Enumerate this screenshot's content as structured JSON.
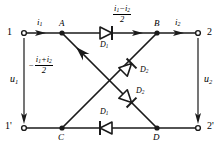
{
  "figure": {
    "type": "circuit-diagram",
    "stroke_color": "#1a1a1a",
    "background_color": "#ffffff"
  },
  "terminals": [
    {
      "name": "terminal-1",
      "label": "1",
      "x": 18,
      "y": 33
    },
    {
      "name": "terminal-2",
      "label": "2",
      "x": 204,
      "y": 33
    },
    {
      "name": "terminal-1-prime",
      "label": "1'",
      "x": 18,
      "y": 128
    },
    {
      "name": "terminal-2-prime",
      "label": "2'",
      "x": 204,
      "y": 128
    }
  ],
  "nodes": [
    {
      "name": "node-a",
      "label": "A",
      "x": 62,
      "y": 33
    },
    {
      "name": "node-b",
      "label": "B",
      "x": 157,
      "y": 33
    },
    {
      "name": "node-c",
      "label": "C",
      "x": 62,
      "y": 128
    },
    {
      "name": "node-d",
      "label": "D",
      "x": 157,
      "y": 128
    }
  ],
  "currents": {
    "i1": "i",
    "i1_sub": "1",
    "i2": "i",
    "i2_sub": "2",
    "top_branch": {
      "numerator_a": "i",
      "numerator_a_sub": "1",
      "minus": "−",
      "numerator_b": "i",
      "numerator_b_sub": "2",
      "denominator": "2"
    },
    "diagonal_branch": {
      "sign": "−",
      "numerator_a": "i",
      "numerator_a_sub": "1",
      "plus": "+",
      "numerator_b": "i",
      "numerator_b_sub": "2",
      "denominator": "2"
    }
  },
  "voltages": [
    {
      "name": "voltage-u1",
      "label": "u",
      "sub": "1",
      "direction": "down"
    },
    {
      "name": "voltage-u2",
      "label": "u",
      "sub": "2",
      "direction": "down"
    }
  ],
  "diodes": [
    {
      "name": "diode-d1-top",
      "label": "D",
      "sub": "1",
      "orientation": "right",
      "branch": "A-B"
    },
    {
      "name": "diode-d1-bottom",
      "label": "D",
      "sub": "1",
      "orientation": "left",
      "branch": "C-D"
    },
    {
      "name": "diode-d2-upper",
      "label": "D",
      "sub": "2",
      "orientation": "up-right",
      "branch": "C-B"
    },
    {
      "name": "diode-d2-lower",
      "label": "D",
      "sub": "2",
      "orientation": "up-right",
      "branch": "A-D"
    }
  ]
}
